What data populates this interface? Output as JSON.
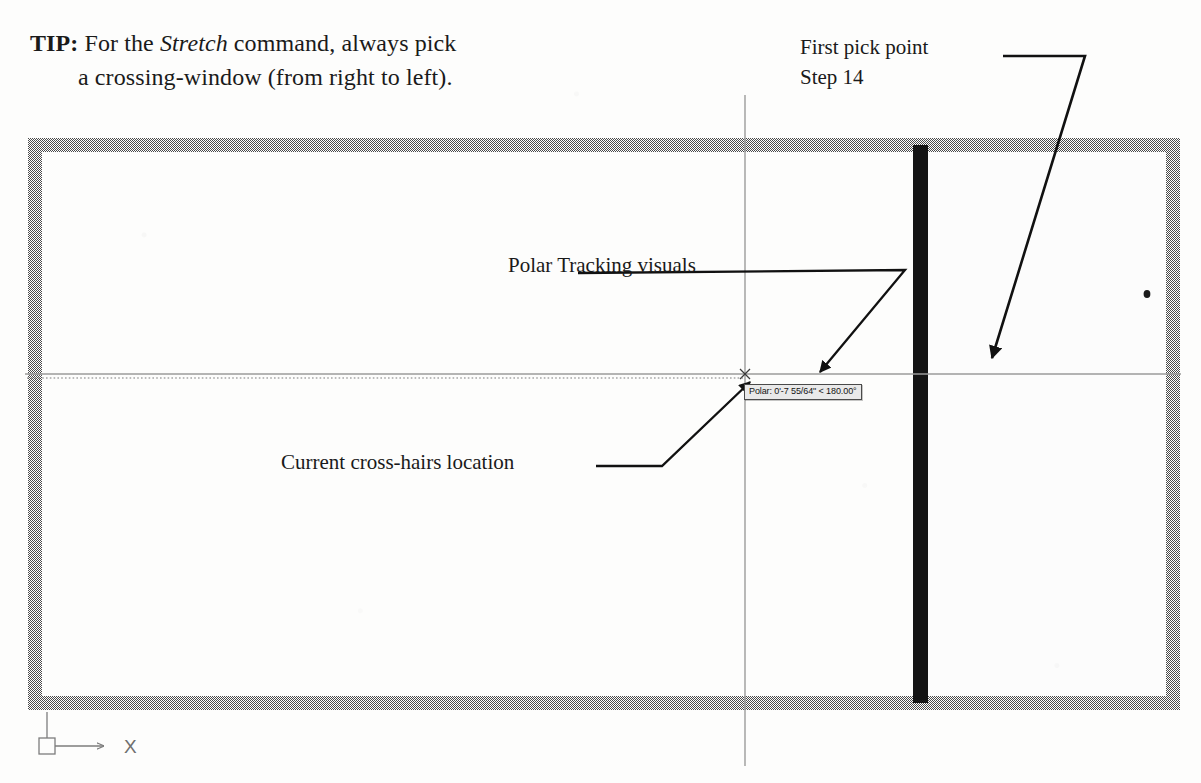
{
  "tip": {
    "lead": "TIP:",
    "text_before": " For the ",
    "emphasis": "Stretch",
    "text_after": " command, always pick",
    "line2": "a crossing-window (from right to left)."
  },
  "callouts": {
    "first_pick": {
      "line1": "First pick point",
      "line2": "Step 14"
    },
    "polar_tracking": "Polar Tracking visuals",
    "crosshairs": "Current cross-hairs location"
  },
  "cad": {
    "polar_tooltip": "Polar: 0'-7 55/64\" < 180.00°",
    "ucs_axis_label": "X",
    "crosshair": {
      "x": 745,
      "y": 374
    },
    "colors": {
      "wall_gray": "#8a8a8a",
      "stretch_bar_black": "#141414",
      "crosshair_gray": "#9b9b9b",
      "leader_black": "#111111",
      "ucs_gray": "#7d7d7d",
      "tooltip_bg": "#e9e9e9",
      "paper": "#fdfdfc"
    },
    "geometry": {
      "outer_rect": {
        "x": 28,
        "y": 138,
        "w": 1152,
        "h": 572
      },
      "wall_thickness": 14,
      "stretch_bar_x": 920,
      "vertical_crosshair_x": 745,
      "horizontal_crosshair_y": 374
    }
  }
}
